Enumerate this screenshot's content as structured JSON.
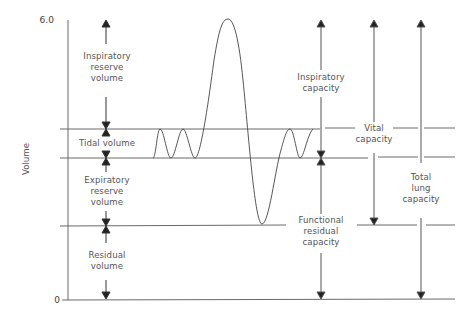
{
  "diagram": {
    "type": "lung-volumes-spirogram",
    "axis": {
      "ylabel": "Volume",
      "tick_top": "6.0",
      "tick_bottom": "0"
    },
    "levels": [
      {
        "name": "max-inspiration",
        "y": 19
      },
      {
        "name": "tidal-top",
        "y": 129
      },
      {
        "name": "tidal-bottom",
        "y": 158
      },
      {
        "name": "max-expiration",
        "y": 226
      },
      {
        "name": "zero",
        "y": 300
      }
    ],
    "volumes": {
      "inspiratory_reserve": "Inspiratory\nreserve\nvolume",
      "tidal": "Tidal volume",
      "expiratory_reserve": "Expiratory\nreserve\nvolume",
      "residual": "Residual\nvolume"
    },
    "capacities": {
      "inspiratory": "Inspiratory\ncapacity",
      "vital": "Vital\ncapacity",
      "functional_residual": "Functional\nresidual\ncapacity",
      "total_lung": "Total\nlung\ncapacity"
    },
    "colors": {
      "line": "#6a6a6a",
      "curve": "#444444",
      "arrow": "#222222",
      "text": "#555555"
    }
  }
}
